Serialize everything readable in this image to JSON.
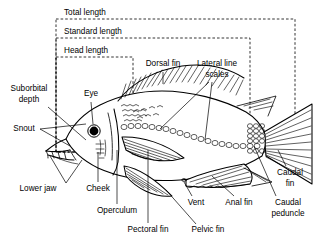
{
  "figure": {
    "type": "labeled-line-drawing",
    "background_color": "#ffffff",
    "line_color": "#000000",
    "width": 316,
    "height": 245
  },
  "measurement_boxes": [
    {
      "id": "total-length",
      "label": "Total length",
      "label_x": 100,
      "label_y": 13,
      "box": {
        "x": 56,
        "y": 19,
        "width": 239,
        "height": 133
      },
      "style": "dashed"
    },
    {
      "id": "standard-length",
      "label": "Standard length",
      "label_x": 106,
      "label_y": 32,
      "box": {
        "x": 56,
        "y": 38,
        "width": 194,
        "height": 114
      },
      "style": "dashed"
    },
    {
      "id": "head-length",
      "label": "Head length",
      "label_x": 98,
      "label_y": 51,
      "box": {
        "x": 56,
        "y": 57,
        "width": 77,
        "height": 95
      },
      "style": "dashed"
    }
  ],
  "labels": [
    {
      "id": "suborbital-depth",
      "lines": [
        "Suborbital",
        "depth"
      ],
      "x": 29,
      "y": 93,
      "anchor": "middle"
    },
    {
      "id": "eye",
      "lines": [
        "Eye"
      ],
      "x": 91,
      "y": 94,
      "anchor": "middle"
    },
    {
      "id": "snout",
      "lines": [
        "Snout"
      ],
      "x": 24,
      "y": 129,
      "anchor": "middle"
    },
    {
      "id": "lower-jaw",
      "lines": [
        "Lower jaw"
      ],
      "x": 38,
      "y": 189,
      "anchor": "middle"
    },
    {
      "id": "cheek",
      "lines": [
        "Cheek"
      ],
      "x": 98,
      "y": 189,
      "anchor": "middle"
    },
    {
      "id": "operculum",
      "lines": [
        "Operculum"
      ],
      "x": 117,
      "y": 211,
      "anchor": "middle"
    },
    {
      "id": "pectoral-fin",
      "lines": [
        "Pectoral fin"
      ],
      "x": 148,
      "y": 230,
      "anchor": "middle"
    },
    {
      "id": "pelvic-fin",
      "lines": [
        "Pelvic fin"
      ],
      "x": 208,
      "y": 230,
      "anchor": "middle"
    },
    {
      "id": "vent",
      "lines": [
        "Vent"
      ],
      "x": 196,
      "y": 203,
      "anchor": "middle"
    },
    {
      "id": "anal-fin",
      "lines": [
        "Anal fin"
      ],
      "x": 239,
      "y": 203,
      "anchor": "middle"
    },
    {
      "id": "dorsal-fin",
      "lines": [
        "Dorsal fin"
      ],
      "x": 163,
      "y": 64,
      "anchor": "middle"
    },
    {
      "id": "lateral-line-scales",
      "lines": [
        "Lateral line",
        "scales"
      ],
      "x": 217,
      "y": 64,
      "anchor": "middle"
    },
    {
      "id": "caudal-fin",
      "lines": [
        "Caudal",
        "fin"
      ],
      "x": 290,
      "y": 173,
      "anchor": "middle"
    },
    {
      "id": "caudal-peduncle",
      "lines": [
        "Caudal",
        "peduncle"
      ],
      "x": 288,
      "y": 203,
      "anchor": "middle"
    }
  ],
  "anatomy_parts": [
    "Total length",
    "Standard length",
    "Head length",
    "Suborbital depth",
    "Eye",
    "Snout",
    "Lower jaw",
    "Cheek",
    "Operculum",
    "Pectoral fin",
    "Pelvic fin",
    "Vent",
    "Anal fin",
    "Dorsal fin",
    "Lateral line scales",
    "Caudal fin",
    "Caudal peduncle"
  ]
}
